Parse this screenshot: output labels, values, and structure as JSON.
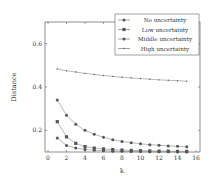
{
  "chart_data": {
    "type": "line",
    "title": "",
    "xlabel": "k",
    "ylabel": "Distance",
    "xlim": [
      0,
      16
    ],
    "ylim": [
      0.1,
      0.7
    ],
    "xticks": [
      0,
      2,
      4,
      6,
      8,
      10,
      12,
      14,
      16
    ],
    "yticks": [
      0.2,
      0.4,
      0.6
    ],
    "xtick_labels": [
      "0",
      "2",
      "4",
      "6",
      "8",
      "10",
      "12",
      "14",
      "16"
    ],
    "ytick_labels": [
      "0.2",
      "0.4",
      "0.6"
    ],
    "grid": false,
    "legend_position": "top-right",
    "x": [
      1,
      2,
      3,
      4,
      5,
      6,
      7,
      8,
      9,
      10,
      11,
      12,
      13,
      14,
      15
    ],
    "series": [
      {
        "name": "No uncertainty",
        "marker": "circle",
        "values": [
          0.165,
          0.13,
          0.118,
          0.112,
          0.108,
          0.106,
          0.104,
          0.103,
          0.102,
          0.102,
          0.101,
          0.101,
          0.101,
          0.1,
          0.1
        ]
      },
      {
        "name": "Low uncertainty",
        "marker": "square",
        "values": [
          0.24,
          0.17,
          0.14,
          0.125,
          0.118,
          0.114,
          0.111,
          0.109,
          0.107,
          0.106,
          0.105,
          0.104,
          0.104,
          0.103,
          0.103
        ]
      },
      {
        "name": "Middle uncertainty",
        "marker": "circle",
        "values": [
          0.34,
          0.27,
          0.228,
          0.2,
          0.182,
          0.168,
          0.157,
          0.149,
          0.143,
          0.138,
          0.134,
          0.131,
          0.128,
          0.126,
          0.124
        ]
      },
      {
        "name": "High uncertainty",
        "marker": "dot",
        "values": [
          0.483,
          0.475,
          0.469,
          0.463,
          0.458,
          0.453,
          0.449,
          0.445,
          0.442,
          0.439,
          0.436,
          0.433,
          0.431,
          0.429,
          0.427
        ]
      }
    ]
  }
}
